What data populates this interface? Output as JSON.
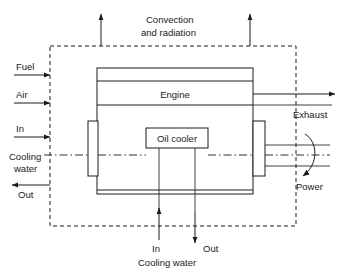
{
  "diagram": {
    "colors": {
      "line": "#1a1a1a",
      "background": "#ffffff",
      "text": "#1a1a1a"
    },
    "boundary": {
      "name": "control-volume-boundary",
      "style": "dashed"
    },
    "blocks": {
      "engine": "Engine",
      "oil_cooler": "Oil cooler"
    },
    "labels": {
      "convection_line1": "Convection",
      "convection_line2": "and radiation",
      "fuel": "Fuel",
      "air": "Air",
      "cooling_in": "In",
      "cooling_water_left_line1": "Cooling",
      "cooling_water_left_line2": "water",
      "cooling_out": "Out",
      "exhaust": "Exhaust",
      "power": "Power",
      "bottom_in": "In",
      "bottom_out": "Out",
      "bottom_cooling_water": "Cooling water"
    },
    "flows": [
      {
        "name": "fuel-inlet",
        "label": "Fuel",
        "direction": "right",
        "side": "left"
      },
      {
        "name": "air-inlet",
        "label": "Air",
        "direction": "right",
        "side": "left"
      },
      {
        "name": "cooling-water-inlet",
        "label": "In",
        "direction": "right",
        "side": "left"
      },
      {
        "name": "cooling-water-outlet",
        "label": "Out",
        "direction": "left",
        "side": "left"
      },
      {
        "name": "convection-radiation-left",
        "label": "Convection and radiation",
        "direction": "up",
        "side": "top"
      },
      {
        "name": "convection-radiation-right",
        "label": "Convection and radiation",
        "direction": "up",
        "side": "top"
      },
      {
        "name": "exhaust-outlet",
        "label": "Exhaust",
        "direction": "right",
        "side": "right"
      },
      {
        "name": "power-output",
        "label": "Power",
        "direction": "rotational",
        "side": "right"
      },
      {
        "name": "oil-cooler-water-in",
        "label": "In",
        "direction": "up",
        "side": "bottom"
      },
      {
        "name": "oil-cooler-water-out",
        "label": "Out",
        "direction": "down",
        "side": "bottom"
      }
    ]
  }
}
